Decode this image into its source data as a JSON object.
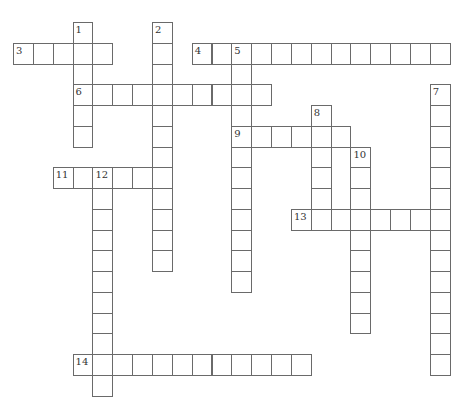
{
  "puzzle": {
    "type": "crossword",
    "grid": {
      "origin_x": 13,
      "origin_y": 22,
      "cell_w": 19.85,
      "cell_h": 20.75,
      "line_color": "#6a6a6a",
      "number_color": "#333333"
    },
    "entries": [
      {
        "number": "1",
        "direction": "down",
        "row": 0,
        "col": 3,
        "length": 6
      },
      {
        "number": "2",
        "direction": "down",
        "row": 0,
        "col": 7,
        "length": 12
      },
      {
        "number": "3",
        "direction": "across",
        "row": 1,
        "col": 0,
        "length": 5
      },
      {
        "number": "4",
        "direction": "across",
        "row": 1,
        "col": 9,
        "length": 13
      },
      {
        "number": "5",
        "direction": "down",
        "row": 1,
        "col": 11,
        "length": 12
      },
      {
        "number": "6",
        "direction": "across",
        "row": 3,
        "col": 3,
        "length": 10
      },
      {
        "number": "7",
        "direction": "down",
        "row": 3,
        "col": 21,
        "length": 14
      },
      {
        "number": "8",
        "direction": "down",
        "row": 4,
        "col": 15,
        "length": 6
      },
      {
        "number": "9",
        "direction": "across",
        "row": 5,
        "col": 11,
        "length": 6
      },
      {
        "number": "10",
        "direction": "down",
        "row": 6,
        "col": 17,
        "length": 9
      },
      {
        "number": "11",
        "direction": "across",
        "row": 7,
        "col": 2,
        "length": 6
      },
      {
        "number": "12",
        "direction": "down",
        "row": 7,
        "col": 4,
        "length": 11
      },
      {
        "number": "13",
        "direction": "across",
        "row": 9,
        "col": 14,
        "length": 8
      },
      {
        "number": "14",
        "direction": "across",
        "row": 16,
        "col": 3,
        "length": 12
      }
    ]
  }
}
